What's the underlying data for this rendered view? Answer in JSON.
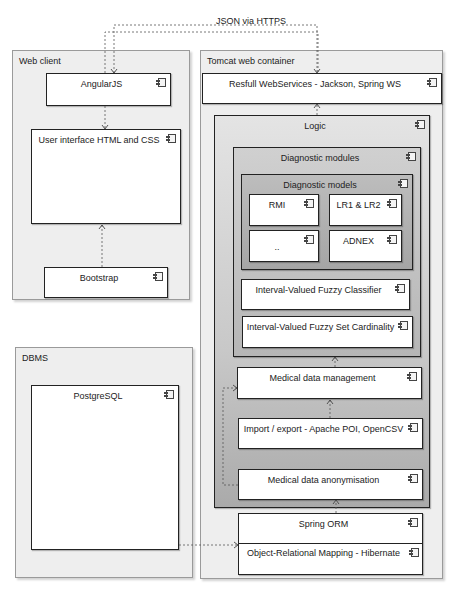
{
  "connector_label": "JSON via HTTPS",
  "nodes": {
    "web_client": {
      "label": "Web client",
      "components": {
        "angularjs": "AngularJS",
        "ui": "User interface HTML and CSS",
        "bootstrap": "Bootstrap"
      }
    },
    "dbms": {
      "label": "DBMS",
      "components": {
        "postgresql": "PostgreSQL"
      }
    },
    "tomcat": {
      "label": "Tomcat web container",
      "components": {
        "rest": "Resfull WebServices - Jackson, Spring WS",
        "logic": {
          "label": "Logic",
          "diagnostic_modules": {
            "label": "Diagnostic modules",
            "diagnostic_models": {
              "label": "Diagnostic models",
              "items": [
                "RMI",
                "LR1 & LR2",
                "..",
                "ADNEX"
              ]
            },
            "ivfc": "Interval-Valued Fuzzy Classifier",
            "ivfsc": "Interval-Valued Fuzzy Set Cardinality"
          },
          "medical_data_management": "Medical data management",
          "import_export": "Import / export - Apache POI, OpenCSV",
          "anonymisation": "Medical data anonymisation"
        },
        "spring_orm": {
          "label": "Spring ORM",
          "hibernate": "Object-Relational Mapping - Hibernate"
        }
      }
    }
  },
  "icons": {
    "component": "uml-component-icon"
  }
}
